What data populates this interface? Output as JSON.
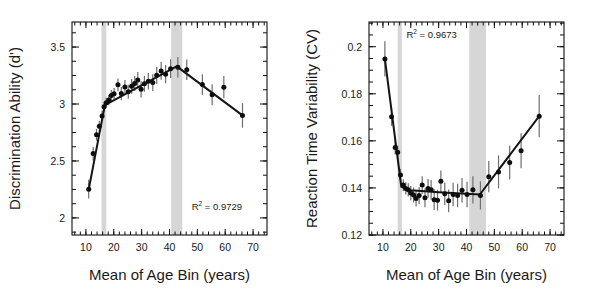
{
  "figure": {
    "background": "#ffffff",
    "band_color": "#d6d6d6",
    "line_color": "#151515",
    "point_color": "#0d0d0d",
    "error_color": "#6e6e6e"
  },
  "panels": [
    {
      "id": "left",
      "name": "discrimination-ability-panel",
      "chart_data": {
        "type": "scatter",
        "title": "",
        "xlabel": "Mean of Age Bin (years)",
        "ylabel": "Discrimination Ability (d')",
        "xlim": [
          5,
          75
        ],
        "ylim": [
          1.85,
          3.72
        ],
        "xticks": [
          10,
          20,
          30,
          40,
          50,
          60,
          70
        ],
        "xticklabels": [
          "10",
          "20",
          "30",
          "40",
          "50",
          "60",
          "70"
        ],
        "yticks": [
          2,
          2.5,
          3,
          3.5
        ],
        "yticklabels": [
          "2",
          "2.5",
          "3",
          "3.5"
        ],
        "minor_xtick_step": 2,
        "minor_ytick_step": 0.125,
        "grid": false,
        "annotation": {
          "text": "R2 = 0.9729",
          "base": "R",
          "sup": "2",
          "rest": " = 0.9729",
          "x": 57,
          "y": 2.07
        },
        "shaded_bands": [
          {
            "x0": 15.6,
            "x1": 17.3
          },
          {
            "x0": 40.6,
            "x1": 44.6
          }
        ],
        "fit_line": [
          {
            "x": 11.0,
            "y": 2.25
          },
          {
            "x": 16.8,
            "y": 2.99
          },
          {
            "x": 42.6,
            "y": 3.33
          },
          {
            "x": 66.2,
            "y": 2.9
          }
        ],
        "points": [
          {
            "x": 11.0,
            "y": 2.252,
            "err": 0.082
          },
          {
            "x": 12.6,
            "y": 2.565,
            "err": 0.06
          },
          {
            "x": 13.8,
            "y": 2.73,
            "err": 0.052
          },
          {
            "x": 14.8,
            "y": 2.805,
            "err": 0.048
          },
          {
            "x": 15.8,
            "y": 2.895,
            "err": 0.045
          },
          {
            "x": 16.5,
            "y": 2.975,
            "err": 0.043
          },
          {
            "x": 17.3,
            "y": 3.012,
            "err": 0.042
          },
          {
            "x": 18.2,
            "y": 3.035,
            "err": 0.046
          },
          {
            "x": 19.1,
            "y": 3.075,
            "err": 0.048
          },
          {
            "x": 20.1,
            "y": 3.09,
            "err": 0.05
          },
          {
            "x": 21.5,
            "y": 3.168,
            "err": 0.056
          },
          {
            "x": 22.7,
            "y": 3.092,
            "err": 0.058
          },
          {
            "x": 24.0,
            "y": 3.15,
            "err": 0.06
          },
          {
            "x": 25.2,
            "y": 3.108,
            "err": 0.062
          },
          {
            "x": 26.4,
            "y": 3.155,
            "err": 0.064
          },
          {
            "x": 27.5,
            "y": 3.18,
            "err": 0.066
          },
          {
            "x": 28.6,
            "y": 3.21,
            "err": 0.07
          },
          {
            "x": 29.8,
            "y": 3.13,
            "err": 0.072
          },
          {
            "x": 31.0,
            "y": 3.178,
            "err": 0.07
          },
          {
            "x": 32.4,
            "y": 3.2,
            "err": 0.072
          },
          {
            "x": 34.0,
            "y": 3.188,
            "err": 0.074
          },
          {
            "x": 35.4,
            "y": 3.252,
            "err": 0.076
          },
          {
            "x": 37.0,
            "y": 3.29,
            "err": 0.078
          },
          {
            "x": 38.6,
            "y": 3.262,
            "err": 0.08
          },
          {
            "x": 40.4,
            "y": 3.31,
            "err": 0.082
          },
          {
            "x": 43.0,
            "y": 3.322,
            "err": 0.09
          },
          {
            "x": 46.2,
            "y": 3.3,
            "err": 0.09
          },
          {
            "x": 51.8,
            "y": 3.172,
            "err": 0.09
          },
          {
            "x": 55.3,
            "y": 3.082,
            "err": 0.092
          },
          {
            "x": 59.5,
            "y": 3.148,
            "err": 0.098
          },
          {
            "x": 66.2,
            "y": 2.9,
            "err": 0.108
          }
        ]
      }
    },
    {
      "id": "right",
      "name": "reaction-time-variability-panel",
      "chart_data": {
        "type": "scatter",
        "title": "",
        "xlabel": "Mean of Age Bin (years)",
        "ylabel": "Reaction Time Variability (CV)",
        "xlim": [
          5,
          75
        ],
        "ylim": [
          0.12,
          0.2105
        ],
        "xticks": [
          10,
          20,
          30,
          40,
          50,
          60,
          70
        ],
        "xticklabels": [
          "10",
          "20",
          "30",
          "40",
          "50",
          "60",
          "70"
        ],
        "yticks": [
          0.12,
          0.14,
          0.16,
          0.18,
          0.2
        ],
        "yticklabels": [
          "0.12",
          "0.14",
          "0.16",
          "0.18",
          "0.2"
        ],
        "minor_xtick_step": 2,
        "minor_ytick_step": 0.005,
        "grid": false,
        "annotation": {
          "text": "R2 = 0.9673",
          "base": "R",
          "sup": "2",
          "rest": " = 0.9673",
          "x": 27.5,
          "y": 0.2035
        },
        "shaded_bands": [
          {
            "x0": 15.3,
            "x1": 16.8
          },
          {
            "x0": 41.0,
            "x1": 47.0
          }
        ],
        "fit_line": [
          {
            "x": 10.7,
            "y": 0.1948
          },
          {
            "x": 16.6,
            "y": 0.1405
          },
          {
            "x": 20.0,
            "y": 0.139
          },
          {
            "x": 30.0,
            "y": 0.1382
          },
          {
            "x": 44.8,
            "y": 0.1372
          },
          {
            "x": 66.1,
            "y": 0.1705
          }
        ],
        "points": [
          {
            "x": 10.7,
            "y": 0.1948,
            "err": 0.0075
          },
          {
            "x": 13.1,
            "y": 0.1702,
            "err": 0.0038
          },
          {
            "x": 14.4,
            "y": 0.1572,
            "err": 0.003
          },
          {
            "x": 15.3,
            "y": 0.1552,
            "err": 0.0028
          },
          {
            "x": 16.3,
            "y": 0.1455,
            "err": 0.0026
          },
          {
            "x": 17.3,
            "y": 0.1412,
            "err": 0.0025
          },
          {
            "x": 18.2,
            "y": 0.1398,
            "err": 0.0026
          },
          {
            "x": 19.1,
            "y": 0.1392,
            "err": 0.0028
          },
          {
            "x": 20.0,
            "y": 0.1378,
            "err": 0.003
          },
          {
            "x": 21.0,
            "y": 0.137,
            "err": 0.0032
          },
          {
            "x": 21.9,
            "y": 0.1355,
            "err": 0.0034
          },
          {
            "x": 23.0,
            "y": 0.1368,
            "err": 0.0036
          },
          {
            "x": 24.1,
            "y": 0.1412,
            "err": 0.0038
          },
          {
            "x": 25.1,
            "y": 0.1358,
            "err": 0.004
          },
          {
            "x": 26.2,
            "y": 0.1398,
            "err": 0.004
          },
          {
            "x": 27.3,
            "y": 0.1392,
            "err": 0.0042
          },
          {
            "x": 28.4,
            "y": 0.135,
            "err": 0.0044
          },
          {
            "x": 29.6,
            "y": 0.1348,
            "err": 0.0044
          },
          {
            "x": 30.8,
            "y": 0.1428,
            "err": 0.0046
          },
          {
            "x": 32.2,
            "y": 0.1375,
            "err": 0.0048
          },
          {
            "x": 33.6,
            "y": 0.1345,
            "err": 0.0048
          },
          {
            "x": 35.2,
            "y": 0.1372,
            "err": 0.005
          },
          {
            "x": 36.8,
            "y": 0.1368,
            "err": 0.005
          },
          {
            "x": 38.4,
            "y": 0.139,
            "err": 0.0052
          },
          {
            "x": 40.2,
            "y": 0.1372,
            "err": 0.0054
          },
          {
            "x": 42.3,
            "y": 0.1392,
            "err": 0.0058
          },
          {
            "x": 45.0,
            "y": 0.1368,
            "err": 0.006
          },
          {
            "x": 48.0,
            "y": 0.1448,
            "err": 0.0066
          },
          {
            "x": 51.5,
            "y": 0.1468,
            "err": 0.007
          },
          {
            "x": 55.5,
            "y": 0.1508,
            "err": 0.0072
          },
          {
            "x": 59.6,
            "y": 0.1558,
            "err": 0.0074
          },
          {
            "x": 66.1,
            "y": 0.1705,
            "err": 0.009
          }
        ]
      }
    }
  ]
}
